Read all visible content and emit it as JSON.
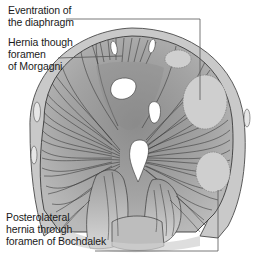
{
  "figure": {
    "labels": [
      {
        "id": "eventration",
        "text": "Eventration of\nthe diaphragm"
      },
      {
        "id": "morgagni",
        "text": "Hernia though\nforamen\nof Morgagni"
      },
      {
        "id": "bochdalek",
        "text": "Posterolateral\nhernia through\nforamen of Bochdalek"
      }
    ],
    "colors": {
      "background": "#ffffff",
      "rim": "#c8c8c8",
      "muscle": "#a9a9a9",
      "muscle_dark": "#7a7a7a",
      "fiber_line": "#3a3a3a",
      "defect_oval": "#cfcfcf",
      "foramen": "#ffffff",
      "leader_line": "#555555"
    }
  }
}
